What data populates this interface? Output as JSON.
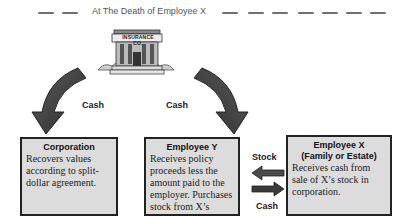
{
  "header": {
    "title": "At The Death of Employee X"
  },
  "insurance_building": {
    "sign": "INSURANCE CO."
  },
  "flows": {
    "left_cash_label": "Cash",
    "right_cash_label": "Cash",
    "stock_label": "Stock",
    "bottom_cash_label": "Cash"
  },
  "boxes": [
    {
      "title": "Corporation",
      "title2": "",
      "body": "Recovers values according to split-dollar agreement."
    },
    {
      "title": "Employee Y",
      "title2": "",
      "body": "Receives policy proceeds less the amount paid to the employer.  Purchases stock from X’s estate."
    },
    {
      "title": "Employee X",
      "title2": "(Family or Estate)",
      "body": "Receives cash from sale of X’s stock in corporation."
    }
  ],
  "colors": {
    "box_fill": "#dcdcdc",
    "box_border": "#222222",
    "arrow": "#3a3a3a"
  }
}
